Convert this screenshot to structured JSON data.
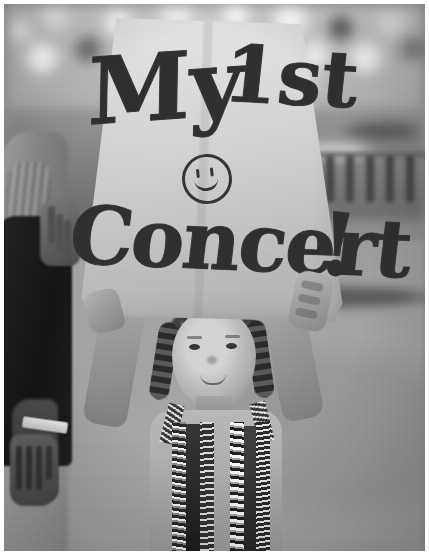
{
  "photo": {
    "title": "My 1st Concert",
    "medium": "black-and-white photograph",
    "orientation": "portrait",
    "width_px": 429,
    "height_px": 559,
    "border": "thin white photographic margin"
  },
  "sign": {
    "description": "handmade poster-board sign held overhead",
    "line1": "My",
    "line2": "1st",
    "line3": "Concert",
    "punctuation": "!",
    "full_text": "My 1st Concert!",
    "smiley_icon": "smiley-face-icon",
    "paper_color": "#d6d3ca",
    "ink_color": "#34322d",
    "lettering_style": "hand-drawn bubble outline with scribbled fill"
  },
  "subjects": {
    "child": {
      "label": "young girl holding sign overhead",
      "hair": "braided pigtails",
      "clothing": "sequined striped top",
      "pose": "both arms raised"
    },
    "adult": {
      "label": "adult standing at left edge",
      "hair": "long hair",
      "clothing": "dark top",
      "accessory": "white wristband"
    }
  },
  "background": {
    "crowd": "blurred out-of-focus crowd",
    "barrier": "metal crowd-control barricade",
    "ground": "grey pavement"
  },
  "palette": {
    "sign_paper": "#d6d3ca",
    "ink": "#34322d",
    "ground": "#a3a098",
    "dark_clothing": "#211f1c",
    "highlight": "#f2efe7"
  }
}
